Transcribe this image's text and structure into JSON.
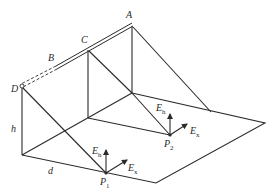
{
  "figure": {
    "stroke_color": "#2a2a2a",
    "background": "#ffffff"
  },
  "labels": {
    "A": "A",
    "B": "B",
    "C": "C",
    "D": "D",
    "h": "h",
    "d": "d",
    "P1": "P",
    "P1_sub": "1",
    "P2": "P",
    "P2_sub": "2",
    "Eh1": "E",
    "Eh1_sub": "h",
    "Ex1": "E",
    "Ex1_sub": "x",
    "Eh2": "E",
    "Eh2_sub": "h",
    "Ex2": "E",
    "Ex2_sub": "x"
  }
}
